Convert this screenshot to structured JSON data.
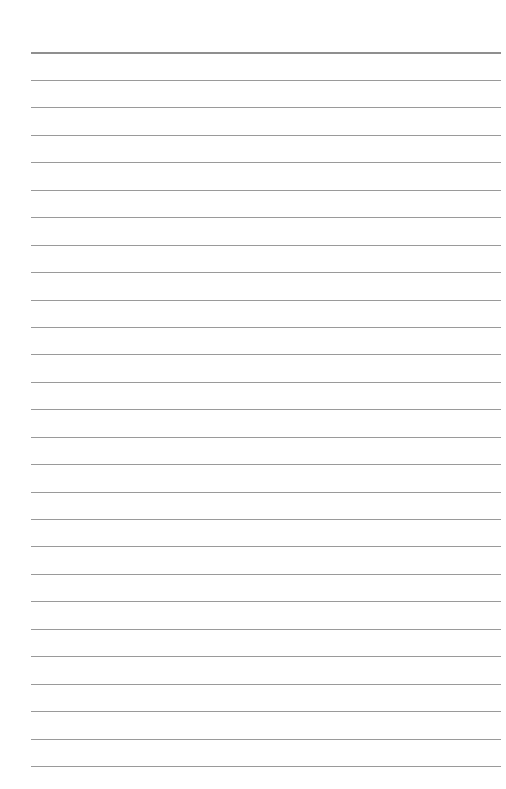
{
  "page": {
    "type": "lined-notebook-page",
    "background_color": "#ffffff",
    "line_color": "#9a9a9a",
    "top_line": {
      "y": 52,
      "thickness": 2
    },
    "lines": {
      "count": 26,
      "first_y": 80,
      "spacing": 27.44,
      "x_start": 31,
      "x_end": 501
    },
    "text_content": []
  }
}
